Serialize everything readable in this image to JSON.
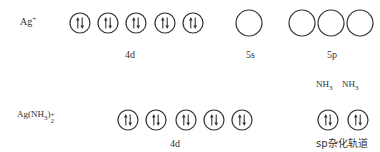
{
  "rows": [
    {
      "species": "Ag",
      "species_charge": "+",
      "groups": [
        {
          "label": "4d",
          "orbitals": [
            {
              "cx": 80,
              "cy": 23,
              "r": 10,
              "electrons": "paired"
            },
            {
              "cx": 108,
              "cy": 23,
              "r": 10,
              "electrons": "paired"
            },
            {
              "cx": 136,
              "cy": 23,
              "r": 10,
              "electrons": "paired"
            },
            {
              "cx": 165,
              "cy": 23,
              "r": 10,
              "electrons": "paired"
            },
            {
              "cx": 193,
              "cy": 23,
              "r": 10,
              "electrons": "paired"
            }
          ]
        },
        {
          "label": "5s",
          "orbitals": [
            {
              "cx": 249,
              "cy": 23,
              "r": 13,
              "electrons": "empty"
            }
          ]
        },
        {
          "label": "5p",
          "orbitals": [
            {
              "cx": 302,
              "cy": 23,
              "r": 13,
              "electrons": "empty"
            },
            {
              "cx": 331,
              "cy": 23,
              "r": 13,
              "electrons": "empty"
            },
            {
              "cx": 360,
              "cy": 23,
              "r": 13,
              "electrons": "empty"
            }
          ]
        }
      ]
    },
    {
      "species": "Ag(NH",
      "species_sub1": "3",
      "species_close": ")",
      "species_charge": "+",
      "species_sub2": "2",
      "groups": [
        {
          "label": "4d",
          "orbitals": [
            {
              "cx": 128,
              "cy": 120,
              "r": 10,
              "electrons": "paired"
            },
            {
              "cx": 156,
              "cy": 120,
              "r": 10,
              "electrons": "paired"
            },
            {
              "cx": 186,
              "cy": 120,
              "r": 10,
              "electrons": "paired"
            },
            {
              "cx": 214,
              "cy": 120,
              "r": 10,
              "electrons": "paired"
            },
            {
              "cx": 242,
              "cy": 120,
              "r": 10,
              "electrons": "paired"
            }
          ]
        },
        {
          "label": "sp杂化轨道",
          "ligands": [
            "NH3",
            "NH3"
          ],
          "orbitals": [
            {
              "cx": 328,
              "cy": 120,
              "r": 10,
              "electrons": "paired"
            },
            {
              "cx": 358,
              "cy": 120,
              "r": 10,
              "electrons": "paired"
            }
          ]
        }
      ]
    }
  ],
  "labels": {
    "row1_4d": "4d",
    "row1_5s": "5s",
    "row1_5p": "5p",
    "row2_4d": "4d",
    "row2_sp": "sp杂化轨道",
    "ligand_main": "NH",
    "ligand_sub": "3",
    "ag_plus_main": "Ag",
    "ag_plus_charge": "+",
    "complex_main": "Ag(NH",
    "complex_sub3": "3",
    "complex_close": ")",
    "complex_sub2": "2",
    "complex_charge": "+",
    "cut_off_text": "……"
  },
  "colors": {
    "ink": "#333333",
    "background": "#ffffff"
  }
}
